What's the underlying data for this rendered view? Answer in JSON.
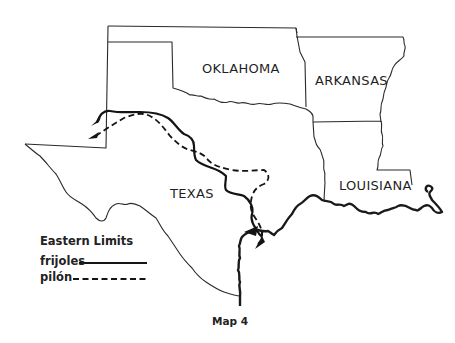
{
  "map": {
    "caption": "Map 4",
    "states": [
      {
        "name": "OKLAHOMA",
        "x": 202,
        "y": 60
      },
      {
        "name": "ARKANSAS",
        "x": 316,
        "y": 72
      },
      {
        "name": "TEXAS",
        "x": 170,
        "y": 185
      },
      {
        "name": "LOUISIANA",
        "x": 340,
        "y": 177
      }
    ],
    "legend": {
      "title": "Eastern Limits",
      "items": [
        {
          "label": "frijoles",
          "style": "solid"
        },
        {
          "label": "pilón",
          "style": "dashed"
        }
      ]
    },
    "colors": {
      "background": "#ffffff",
      "ink": "#141414"
    }
  }
}
